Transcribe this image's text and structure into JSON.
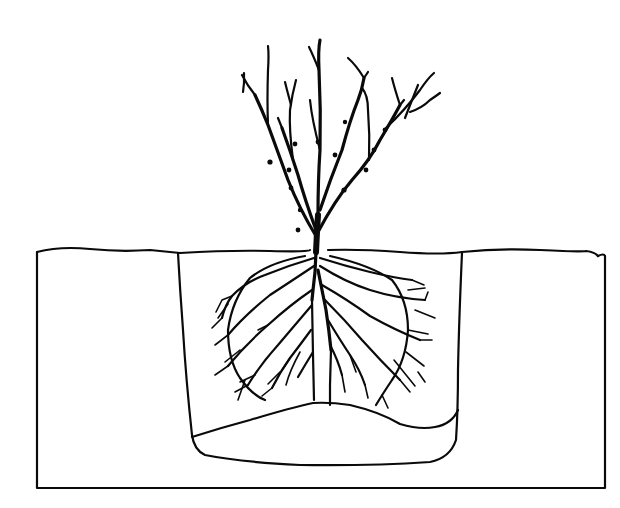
{
  "figure": {
    "ink_color": "#0a0a0a",
    "background_color": "#ffffff",
    "parts": {
      "soil_block": "soil-cross-section",
      "planting_hole": "planting-hole",
      "soil_mound": "cone-mound",
      "plant_top": "branches",
      "root_system": "spread-roots"
    }
  }
}
